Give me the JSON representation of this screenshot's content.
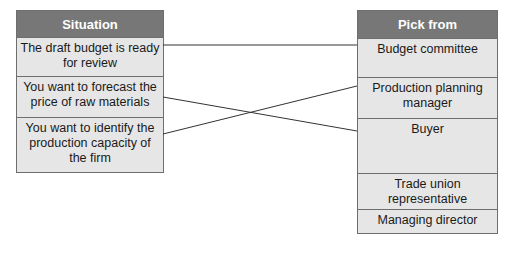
{
  "situation": {
    "header": "Situation",
    "items": [
      "The draft budget is ready for review",
      "You want to forecast the price of raw materials",
      "You want to identify the production capacity of the firm"
    ]
  },
  "pick_from": {
    "header": "Pick from",
    "items": [
      "Budget committee",
      "Production planning manager",
      "Buyer",
      "Trade union representative",
      "Managing director"
    ]
  },
  "connections": [
    {
      "from": "The draft budget is ready for review",
      "to": "Budget committee"
    },
    {
      "from": "You want to forecast the price of raw materials",
      "to": "Buyer"
    },
    {
      "from": "You want to identify the production capacity of the firm",
      "to": "Production planning manager"
    }
  ],
  "colors": {
    "header_bg": "#777777",
    "cell_bg": "#e6e6e6",
    "border": "#6e6e6e",
    "line": "#333333"
  }
}
